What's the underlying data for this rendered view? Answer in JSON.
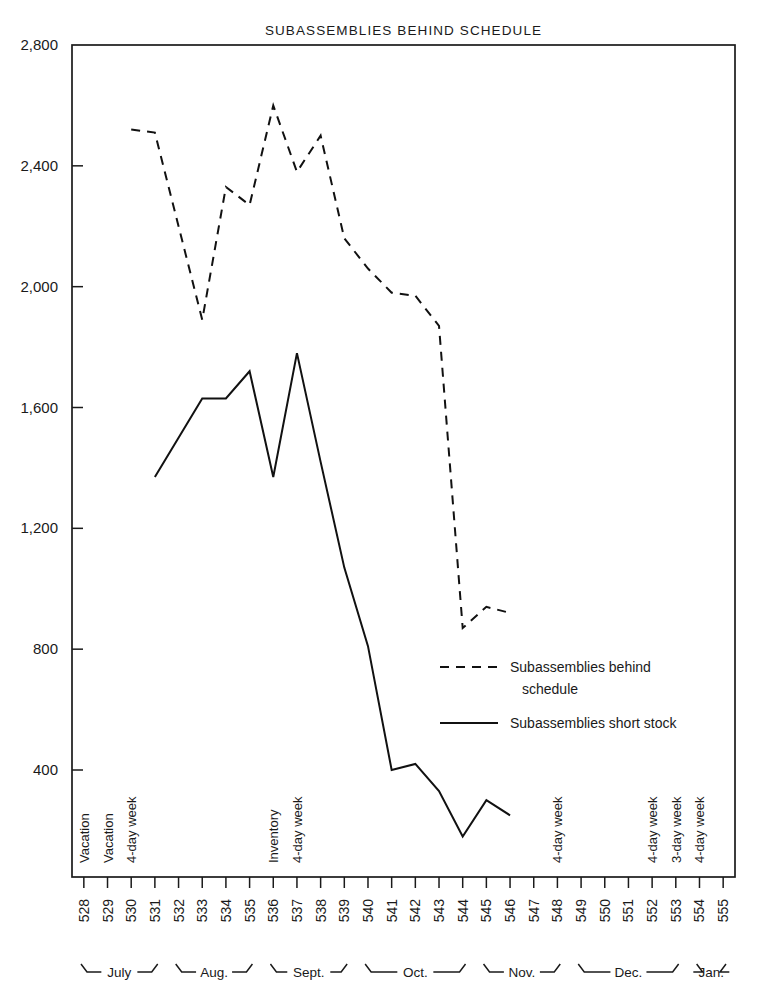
{
  "chart_data": {
    "type": "line",
    "title": "SUBASSEMBLIES BEHIND SCHEDULE",
    "xlabel": "",
    "ylabel": "",
    "ylim": [
      0,
      2800
    ],
    "grid": false,
    "legend_position": "inside-right",
    "y_ticks": [
      "2,800",
      "2,400",
      "2,000",
      "1,600",
      "1,200",
      "800",
      "400"
    ],
    "y_tick_values": [
      2800,
      2400,
      2000,
      1600,
      1200,
      800,
      400
    ],
    "categories": [
      "528",
      "529",
      "530",
      "531",
      "532",
      "533",
      "534",
      "535",
      "536",
      "537",
      "538",
      "539",
      "540",
      "541",
      "542",
      "543",
      "544",
      "545",
      "546",
      "547",
      "548",
      "549",
      "550",
      "551",
      "552",
      "553",
      "554",
      "555"
    ],
    "series": [
      {
        "name": "Subassemblies behind schedule",
        "style": "dashed",
        "x": [
          "530",
          "531",
          "532",
          "533",
          "534",
          "535",
          "536",
          "537",
          "538",
          "539",
          "540",
          "541",
          "542",
          "543",
          "544",
          "545",
          "546"
        ],
        "values": [
          2520,
          2510,
          2200,
          1890,
          2330,
          2270,
          2600,
          2380,
          2500,
          2160,
          2060,
          1980,
          1970,
          1870,
          870,
          940,
          920
        ]
      },
      {
        "name": "Subassemblies short stock",
        "style": "solid",
        "x": [
          "531",
          "532",
          "533",
          "534",
          "535",
          "536",
          "537",
          "538",
          "539",
          "540",
          "541",
          "542",
          "543",
          "544",
          "545",
          "546"
        ],
        "values": [
          1370,
          1500,
          1630,
          1630,
          1720,
          1370,
          1780,
          1420,
          1070,
          810,
          400,
          420,
          330,
          180,
          300,
          250
        ]
      }
    ],
    "legend": [
      {
        "label_line1": "Subassemblies behind",
        "label_line2": "schedule",
        "style": "dashed"
      },
      {
        "label_line1": "Subassemblies short stock",
        "label_line2": "",
        "style": "solid"
      }
    ],
    "annotations": [
      {
        "x": "528",
        "text": "Vacation"
      },
      {
        "x": "529",
        "text": "Vacation"
      },
      {
        "x": "530",
        "text": "4-day week"
      },
      {
        "x": "536",
        "text": "Inventory"
      },
      {
        "x": "537",
        "text": "4-day week"
      },
      {
        "x": "548",
        "text": "4-day week"
      },
      {
        "x": "552",
        "text": "4-day week"
      },
      {
        "x": "553",
        "text": "3-day week"
      },
      {
        "x": "554",
        "text": "4-day week"
      }
    ],
    "month_groups": [
      {
        "label": "July",
        "start": "528",
        "end": "531"
      },
      {
        "label": "Aug.",
        "start": "532",
        "end": "535"
      },
      {
        "label": "Sept.",
        "start": "536",
        "end": "539"
      },
      {
        "label": "Oct.",
        "start": "540",
        "end": "544"
      },
      {
        "label": "Nov.",
        "start": "545",
        "end": "548"
      },
      {
        "label": "Dec.",
        "start": "549",
        "end": "553"
      },
      {
        "label": "Jan.",
        "start": "554",
        "end": "555"
      }
    ],
    "colors": {
      "ink": "#111111",
      "background": "#ffffff"
    }
  }
}
